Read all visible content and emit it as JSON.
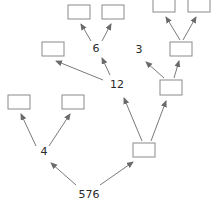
{
  "diagram": {
    "type": "factor-tree",
    "root": "576",
    "nodes": [
      {
        "id": "n576",
        "label": "576"
      },
      {
        "id": "n4",
        "label": "4"
      },
      {
        "id": "n12",
        "label": "12"
      },
      {
        "id": "n6",
        "label": "6"
      },
      {
        "id": "n3",
        "label": "3"
      },
      {
        "id": "b1",
        "label": ""
      },
      {
        "id": "b2",
        "label": ""
      },
      {
        "id": "b3",
        "label": ""
      },
      {
        "id": "b4",
        "label": ""
      },
      {
        "id": "b5",
        "label": ""
      },
      {
        "id": "b6",
        "label": ""
      },
      {
        "id": "b7",
        "label": ""
      },
      {
        "id": "b8",
        "label": ""
      },
      {
        "id": "b9",
        "label": ""
      }
    ],
    "edges": [
      [
        "576",
        "4"
      ],
      [
        "576",
        "box-right-low"
      ],
      [
        "4",
        "box-ll"
      ],
      [
        "4",
        "box-lr"
      ],
      [
        "box-right-low",
        "12"
      ],
      [
        "box-right-low",
        "box-right-mid"
      ],
      [
        "12",
        "box-mid-left"
      ],
      [
        "12",
        "6"
      ],
      [
        "6",
        "box-top-l"
      ],
      [
        "6",
        "box-top-r"
      ],
      [
        "box-right-mid",
        "3"
      ],
      [
        "box-right-mid",
        "box-right-top"
      ],
      [
        "box-right-top",
        "box-tr-l"
      ],
      [
        "box-right-top",
        "box-tr-r"
      ]
    ],
    "labels": {
      "root": "576",
      "four": "4",
      "twelve": "12",
      "six": "6",
      "three": "3"
    },
    "colors": {
      "stroke": "#7a7a7a",
      "box_stroke": "#8a8a8a",
      "text": "#2a2a2a"
    }
  }
}
